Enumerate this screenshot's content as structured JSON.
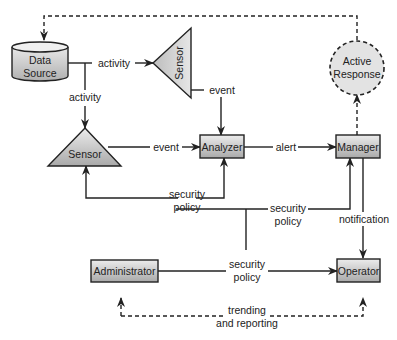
{
  "diagram": {
    "type": "flow-diagram",
    "nodes": {
      "data_source": {
        "line1": "Data",
        "line2": "Source",
        "shape": "cylinder"
      },
      "sensor_top": {
        "label": "Sensor",
        "shape": "triangle-left"
      },
      "sensor_bottom": {
        "label": "Sensor",
        "shape": "triangle-up"
      },
      "analyzer": {
        "label": "Analyzer",
        "shape": "box"
      },
      "manager": {
        "label": "Manager",
        "shape": "box"
      },
      "active_response": {
        "line1": "Active",
        "line2": "Response",
        "shape": "dashed-circle"
      },
      "administrator": {
        "label": "Administrator",
        "shape": "box"
      },
      "operator": {
        "label": "Operator",
        "shape": "box"
      }
    },
    "edges": {
      "activity_right": "activity",
      "activity_down": "activity",
      "event_top": "event",
      "event_bottom": "event",
      "alert": "alert",
      "policy_sensor_line1": "security",
      "policy_sensor_line2": "policy",
      "policy_manager_line1": "security",
      "policy_manager_line2": "policy",
      "notification": "notification",
      "policy_operator_line1": "security",
      "policy_operator_line2": "policy",
      "trending_line1": "trending",
      "trending_line2": "and reporting"
    },
    "colors": {
      "line": "#222222",
      "node_fill_light": "#e6e6e6",
      "node_fill_dark": "#b4b4b4",
      "circle_fill": "#e3e3e3"
    }
  }
}
